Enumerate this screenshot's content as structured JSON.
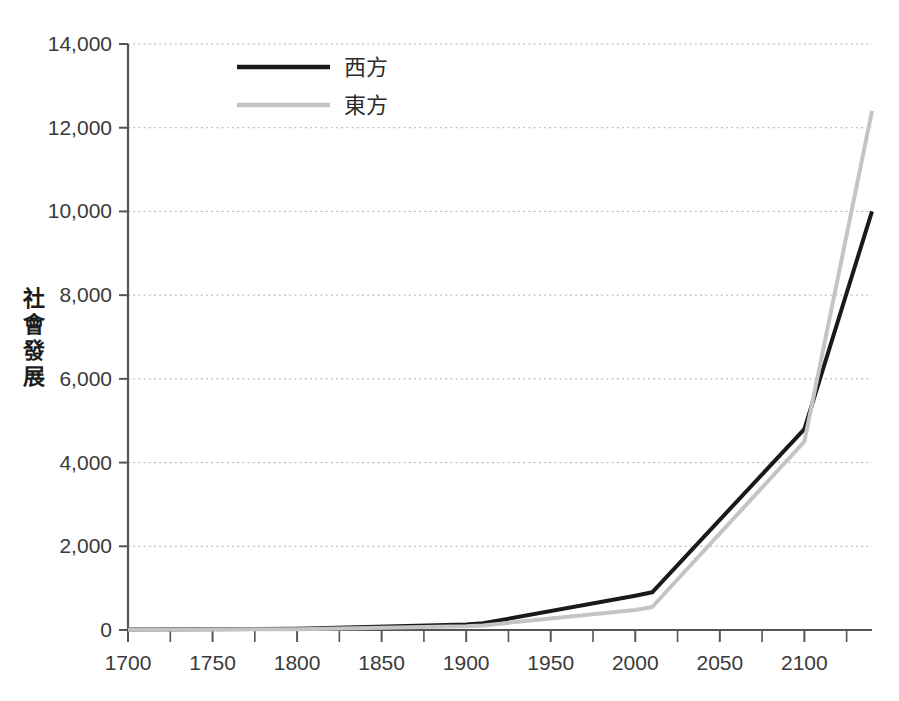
{
  "chart_data": {
    "type": "line",
    "title": "",
    "xlabel": "",
    "ylabel": "社會發展",
    "xlim": [
      1700,
      2140
    ],
    "ylim": [
      0,
      14000
    ],
    "xticks": [
      1700,
      1750,
      1800,
      1850,
      1900,
      1950,
      2000,
      2050,
      2100
    ],
    "xtick_labels": [
      "1700",
      "1750",
      "1800",
      "1850",
      "1900",
      "1950",
      "2000",
      "2050",
      "2100"
    ],
    "yticks": [
      0,
      2000,
      4000,
      6000,
      8000,
      10000,
      12000,
      14000
    ],
    "ytick_labels": [
      "0",
      "2,000",
      "4,000",
      "6,000",
      "8,000",
      "10,000",
      "12,000",
      "14,000"
    ],
    "grid": "horizontal-dotted",
    "legend_position": "top-center",
    "x": [
      1700,
      1800,
      1900,
      1910,
      2000,
      2010,
      2100,
      2140
    ],
    "series": [
      {
        "name": "西方",
        "color": "#1a1a1a",
        "style": "solid",
        "width": 4,
        "values": [
          10,
          30,
          130,
          160,
          820,
          900,
          4800,
          10000
        ]
      },
      {
        "name": "東方",
        "color": "#c4c4c4",
        "style": "solid",
        "width": 4,
        "values": [
          8,
          20,
          90,
          110,
          480,
          550,
          4500,
          12400
        ]
      }
    ],
    "annotations": []
  },
  "legend": {
    "items": [
      {
        "label": "西方",
        "color": "#1a1a1a"
      },
      {
        "label": "東方",
        "color": "#c4c4c4"
      }
    ]
  },
  "axis": {
    "y_label_chars": [
      "社",
      "會",
      "發",
      "展"
    ],
    "axis_color": "#555555",
    "grid_color": "#b0b0b0"
  }
}
